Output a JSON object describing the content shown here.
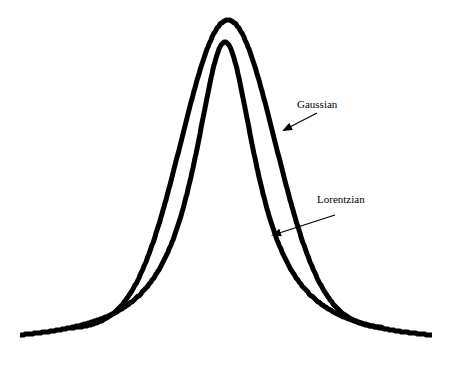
{
  "figure": {
    "title": "",
    "background": "#ffffff",
    "line_color": "#000000",
    "line_width": 5
  },
  "labels": {
    "gaussian": "Gaussian",
    "lorentzian": "Lorentzian"
  },
  "chart_data": {
    "type": "line",
    "title": "",
    "xlabel": "",
    "ylabel": "",
    "grid": false,
    "axes_visible": false,
    "legend": "annotations with arrows",
    "series": [
      {
        "name": "Gaussian",
        "shape": "gaussian",
        "description": "Outer, broader-shouldered peak with short tails",
        "peak_px": [
          228,
          20
        ],
        "baseline_px_y": 329,
        "x_range_px": [
          72,
          383
        ],
        "points_px": [
          [
            72,
            329
          ],
          [
            100,
            322
          ],
          [
            123,
            300
          ],
          [
            150,
            240
          ],
          [
            176,
            150
          ],
          [
            200,
            70
          ],
          [
            215,
            32
          ],
          [
            228,
            20
          ],
          [
            240,
            28
          ],
          [
            258,
            100
          ],
          [
            275,
            150
          ],
          [
            290,
            200
          ],
          [
            310,
            260
          ],
          [
            335,
            300
          ],
          [
            360,
            322
          ],
          [
            383,
            329
          ]
        ]
      },
      {
        "name": "Lorentzian",
        "shape": "lorentzian",
        "description": "Inner, narrower peak with long heavy tails",
        "peak_px": [
          225,
          42
        ],
        "baseline_px_y": 345,
        "x_range_px": [
          20,
          432
        ],
        "points_px": [
          [
            20,
            345
          ],
          [
            60,
            340
          ],
          [
            100,
            330
          ],
          [
            153,
            300
          ],
          [
            180,
            250
          ],
          [
            200,
            150
          ],
          [
            213,
            80
          ],
          [
            225,
            42
          ],
          [
            235,
            70
          ],
          [
            240,
            100
          ],
          [
            258,
            200
          ],
          [
            275,
            250
          ],
          [
            310,
            300
          ],
          [
            350,
            325
          ],
          [
            400,
            338
          ],
          [
            432,
            345
          ]
        ]
      }
    ],
    "annotations": [
      {
        "text": "Gaussian",
        "text_px": [
          297,
          108
        ],
        "arrow_from_px": [
          317,
          113
        ],
        "arrow_to_px": [
          284,
          130
        ]
      },
      {
        "text": "Lorentzian",
        "text_px": [
          317,
          203
        ],
        "arrow_from_px": [
          335,
          215
        ],
        "arrow_to_px": [
          273,
          235
        ]
      }
    ]
  }
}
